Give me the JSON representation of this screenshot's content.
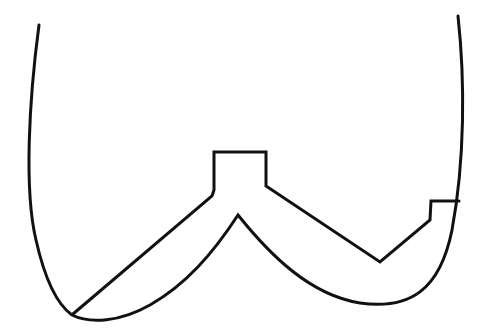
{
  "figure": {
    "type": "line-drawing",
    "stroke_color": "#111111",
    "background": "#ffffff",
    "stroke_width": 3
  }
}
